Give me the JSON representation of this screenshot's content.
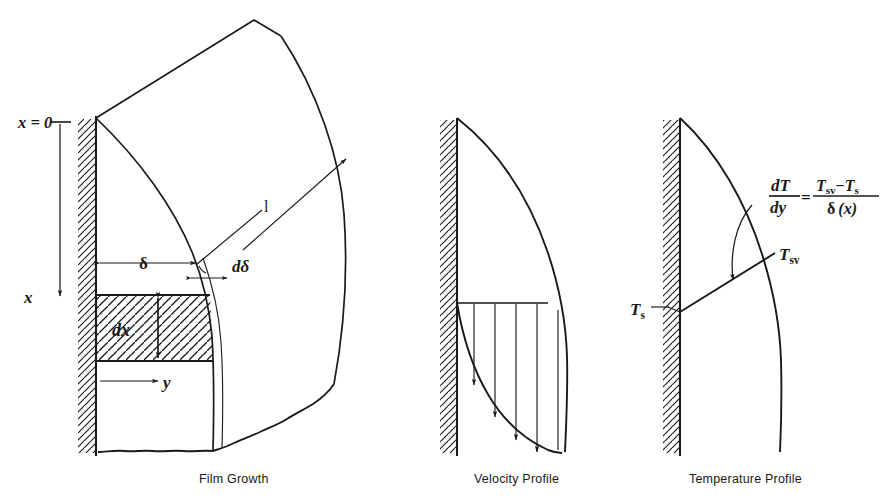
{
  "figure": {
    "background_color": "#ffffff",
    "ink_color": "#1a1a1a",
    "width": 883,
    "height": 503
  },
  "panels": [
    {
      "id": "film-growth",
      "caption": "Film Growth",
      "labels": {
        "x_origin": "x = 0",
        "x_zero_numeral": "0",
        "x_axis": "x",
        "y_axis": "y",
        "length": "l",
        "delta": "δ",
        "d_delta": "dδ",
        "dx": "dx"
      }
    },
    {
      "id": "velocity-profile",
      "caption": "Velocity Profile",
      "labels": {}
    },
    {
      "id": "temperature-profile",
      "caption": "Temperature Profile",
      "labels": {
        "t_surface": "T",
        "t_surface_sub": "s",
        "t_saturation": "T",
        "t_saturation_sub": "sv",
        "eq_num_d": "d",
        "eq_num_T": "T",
        "eq_den_d": "d",
        "eq_den_y": "y",
        "eq_equals": "=",
        "eq_rhs_num_T1": "T",
        "eq_rhs_num_sub1": "sv",
        "eq_rhs_minus": "−",
        "eq_rhs_num_T2": "T",
        "eq_rhs_num_sub2": "s",
        "eq_rhs_den_delta": "δ",
        "eq_rhs_den_x": "(x)"
      }
    }
  ],
  "equation": {
    "plain": "dT/dy = (Tsv - Ts) / δ(x)"
  }
}
